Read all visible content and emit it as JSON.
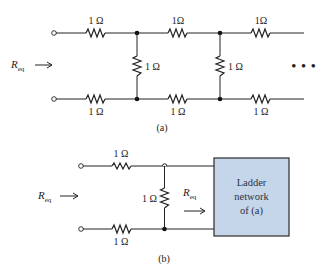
{
  "figure_a": {
    "caption": "(a)",
    "input_label": {
      "main": "R",
      "sub": "eq"
    },
    "top_resistors": [
      "1 Ω",
      "1Ω",
      "1Ω"
    ],
    "bottom_resistors": [
      "1 Ω",
      "1 Ω",
      "1 Ω"
    ],
    "shunt_resistors": [
      "1 Ω",
      "1 Ω"
    ],
    "continuation": "• • •"
  },
  "figure_b": {
    "caption": "(b)",
    "input_label": {
      "main": "R",
      "sub": "eq"
    },
    "inner_label": {
      "main": "R",
      "sub": "eq"
    },
    "top_resistor": "1 Ω",
    "bottom_resistor": "1 Ω",
    "shunt_resistor": "1 Ω",
    "box": {
      "lines": [
        "Ladder",
        "network",
        "of (a)"
      ],
      "fill": "#c5d6ea",
      "border": "#2a2a2a"
    }
  }
}
